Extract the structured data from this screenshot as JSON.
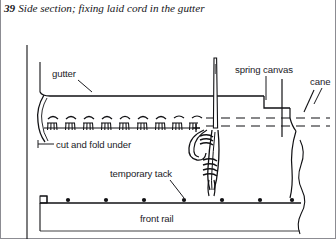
{
  "figure": {
    "number": "39",
    "caption": "Side section; fixing laid cord in the gutter",
    "caption_line1": "Side section; fixing laid cord",
    "caption_line2": "in the gutter"
  },
  "labels": {
    "gutter": "gutter",
    "spring_canvas": "spring canvas",
    "cane": "cane",
    "cut_and_fold_under": "cut and fold under",
    "temporary_tack": "temporary tack",
    "front_rail": "front rail"
  },
  "colors": {
    "ink": "#1b1b1f",
    "line": "#111114",
    "background": "#ffffff",
    "caption_ink": "#16161a"
  },
  "diagram": {
    "type": "line-drawing",
    "elements": [
      "left vertical frame edge",
      "gutter curve",
      "dashed stitch guide lines",
      "row of tacks along gutter",
      "sewing needle passing through spring canvas",
      "laid cord knot",
      "front rail with temporary tacks",
      "torn/broken right edge"
    ],
    "tack_row_count": 10,
    "rail_tack_count": 7,
    "dash_arc_count": 9
  }
}
